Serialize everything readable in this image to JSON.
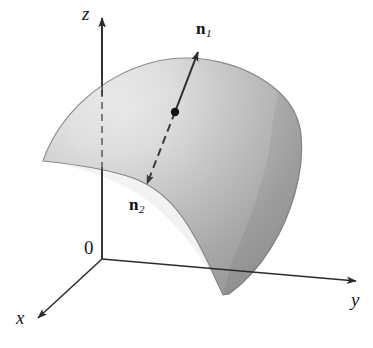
{
  "figure": {
    "kind": "3d-surface-normal-vectors-diagram",
    "background_color": "#ffffff",
    "width": 373,
    "height": 348,
    "axes": {
      "origin_label": "0",
      "z_label": "z",
      "y_label": "y",
      "x_label": "x",
      "line_color": "#2b2b2b",
      "origin_point": [
        102,
        259
      ],
      "z_tip": [
        102,
        12
      ],
      "y_tip": [
        360,
        282
      ],
      "x_tip": [
        33,
        322
      ],
      "z_hidden_segment": [
        78,
        167
      ]
    },
    "surface": {
      "name": "oriented-surface",
      "fill_light": "#dcdcdc",
      "fill_mid": "#b4b4b4",
      "fill_dark": "#9a9a9a",
      "edge_color": "#6e6e6e",
      "cusp_point": [
        223,
        295
      ]
    },
    "normals": {
      "tangent_point": [
        175,
        112
      ],
      "point_color": "#111111",
      "upward": {
        "label": "n",
        "subscript": "1",
        "style": "solid",
        "tip": [
          200,
          48
        ],
        "color": "#2b2b2b"
      },
      "downward": {
        "label": "n",
        "subscript": "2",
        "style": "dashed",
        "tip": [
          144,
          188
        ],
        "color": "#2b2b2b"
      }
    }
  }
}
